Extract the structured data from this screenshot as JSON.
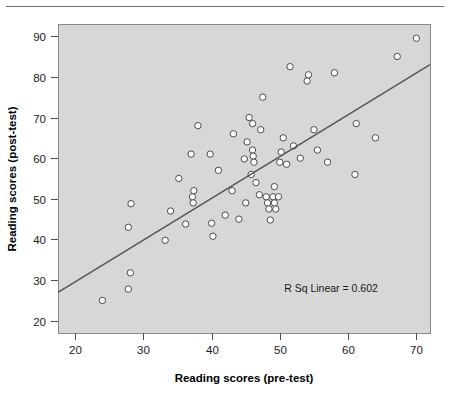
{
  "figure": {
    "background_color": "#ffffff",
    "plot_background_color": "#d7d7d7",
    "plot_border_color": "#8a8a8a",
    "axis_color": "#4d4d4d",
    "marker_edge_color": "#4a4a4a",
    "marker_fill_color": "#ffffff",
    "fit_line_color": "#555555",
    "top_rule_color": "#6e6e6e"
  },
  "chart_data": {
    "type": "scatter",
    "title": "",
    "xlabel": "Reading scores (pre-test)",
    "ylabel": "Reading scores (post-test)",
    "xlim": [
      17.5,
      72.0
    ],
    "ylim": [
      17.0,
      93.0
    ],
    "xticks": [
      20,
      30,
      40,
      50,
      60,
      70
    ],
    "yticks": [
      20,
      30,
      40,
      50,
      60,
      70,
      80,
      90
    ],
    "xtick_labels": [
      "20",
      "30",
      "40",
      "50",
      "60",
      "70"
    ],
    "ytick_labels": [
      "20",
      "30",
      "40",
      "50",
      "60",
      "70",
      "80",
      "90"
    ],
    "grid": false,
    "legend": false,
    "annotations": [
      {
        "name": "r-squared-annotation",
        "text": "R Sq Linear = 0.602",
        "x": 57.5,
        "y": 27.0
      }
    ],
    "fit_line": {
      "name": "linear-fit-line",
      "r_squared": 0.602,
      "x_start": 17.5,
      "y_start": 27.0,
      "x_end": 72.0,
      "y_end": 83.0
    },
    "series": [
      {
        "name": "reading-scores",
        "marker": "open-circle",
        "points": [
          [
            24.0,
            25.0
          ],
          [
            27.8,
            43.0
          ],
          [
            28.2,
            48.8
          ],
          [
            28.1,
            31.8
          ],
          [
            27.8,
            27.8
          ],
          [
            33.2,
            39.8
          ],
          [
            34.0,
            47.0
          ],
          [
            35.2,
            55.0
          ],
          [
            36.2,
            43.8
          ],
          [
            37.2,
            50.5
          ],
          [
            37.3,
            49.0
          ],
          [
            37.4,
            52.0
          ],
          [
            37.0,
            61.0
          ],
          [
            38.0,
            68.0
          ],
          [
            39.8,
            61.0
          ],
          [
            40.2,
            40.8
          ],
          [
            40.0,
            44.0
          ],
          [
            41.0,
            57.0
          ],
          [
            42.0,
            46.0
          ],
          [
            43.0,
            52.0
          ],
          [
            43.2,
            66.0
          ],
          [
            44.0,
            45.0
          ],
          [
            44.8,
            59.8
          ],
          [
            45.0,
            49.0
          ],
          [
            45.2,
            64.0
          ],
          [
            45.5,
            70.0
          ],
          [
            45.8,
            56.0
          ],
          [
            46.0,
            62.0
          ],
          [
            46.1,
            60.5
          ],
          [
            46.2,
            59.0
          ],
          [
            46.0,
            68.5
          ],
          [
            46.5,
            54.0
          ],
          [
            47.0,
            51.0
          ],
          [
            47.2,
            67.0
          ],
          [
            47.5,
            75.0
          ],
          [
            48.0,
            50.5
          ],
          [
            48.2,
            49.0
          ],
          [
            48.4,
            47.5
          ],
          [
            48.6,
            44.8
          ],
          [
            49.0,
            50.5
          ],
          [
            49.2,
            49.0
          ],
          [
            49.4,
            47.5
          ],
          [
            49.2,
            53.0
          ],
          [
            49.8,
            50.5
          ],
          [
            50.0,
            59.0
          ],
          [
            50.2,
            61.5
          ],
          [
            50.5,
            65.0
          ],
          [
            51.0,
            58.5
          ],
          [
            51.5,
            82.5
          ],
          [
            52.0,
            63.0
          ],
          [
            53.0,
            60.0
          ],
          [
            54.0,
            79.0
          ],
          [
            54.2,
            80.5
          ],
          [
            55.0,
            67.0
          ],
          [
            55.5,
            62.0
          ],
          [
            57.0,
            59.0
          ],
          [
            58.0,
            81.0
          ],
          [
            61.0,
            56.0
          ],
          [
            61.2,
            68.5
          ],
          [
            64.0,
            65.0
          ],
          [
            67.2,
            85.0
          ],
          [
            70.0,
            89.5
          ]
        ]
      }
    ]
  }
}
